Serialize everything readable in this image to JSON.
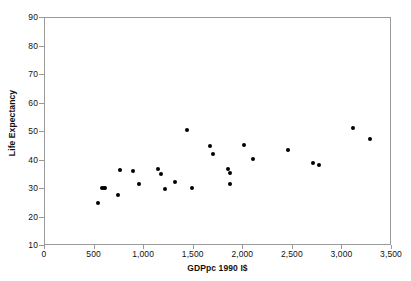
{
  "chart_data": {
    "type": "scatter",
    "title": "",
    "xlabel": "GDPpc 1990 I$",
    "ylabel": "Life Expectancy",
    "xlim": [
      0,
      3500
    ],
    "ylim": [
      10,
      90
    ],
    "xticks": [
      0,
      500,
      1000,
      1500,
      2000,
      2500,
      3000,
      3500
    ],
    "xtick_labels": [
      "0",
      "500",
      "1,000",
      "1,500",
      "2,000",
      "2,500",
      "3,000",
      "3,500"
    ],
    "yticks": [
      10,
      20,
      30,
      40,
      50,
      60,
      70,
      80,
      90
    ],
    "ytick_labels": [
      "10",
      "20",
      "30",
      "40",
      "50",
      "60",
      "70",
      "80",
      "90"
    ],
    "grid": false,
    "legend": false,
    "marker": "filled-circle",
    "marker_color": "#000000",
    "frame_color": "#9a9a9a",
    "points": [
      {
        "x": 548,
        "y": 24.6
      },
      {
        "x": 588,
        "y": 30.0
      },
      {
        "x": 606,
        "y": 30.0
      },
      {
        "x": 620,
        "y": 30.0
      },
      {
        "x": 742,
        "y": 27.6
      },
      {
        "x": 762,
        "y": 36.4
      },
      {
        "x": 900,
        "y": 35.9
      },
      {
        "x": 960,
        "y": 31.4
      },
      {
        "x": 1152,
        "y": 36.5
      },
      {
        "x": 1180,
        "y": 34.8
      },
      {
        "x": 1222,
        "y": 29.6
      },
      {
        "x": 1320,
        "y": 32.2
      },
      {
        "x": 1442,
        "y": 50.4
      },
      {
        "x": 1492,
        "y": 29.9
      },
      {
        "x": 1676,
        "y": 44.6
      },
      {
        "x": 1700,
        "y": 42.0
      },
      {
        "x": 1852,
        "y": 36.6
      },
      {
        "x": 1876,
        "y": 35.2
      },
      {
        "x": 1880,
        "y": 31.3
      },
      {
        "x": 2022,
        "y": 45.1
      },
      {
        "x": 2112,
        "y": 40.1
      },
      {
        "x": 2462,
        "y": 43.5
      },
      {
        "x": 2712,
        "y": 38.6
      },
      {
        "x": 2776,
        "y": 38.2
      },
      {
        "x": 3120,
        "y": 50.9
      },
      {
        "x": 3292,
        "y": 47.3
      }
    ]
  }
}
